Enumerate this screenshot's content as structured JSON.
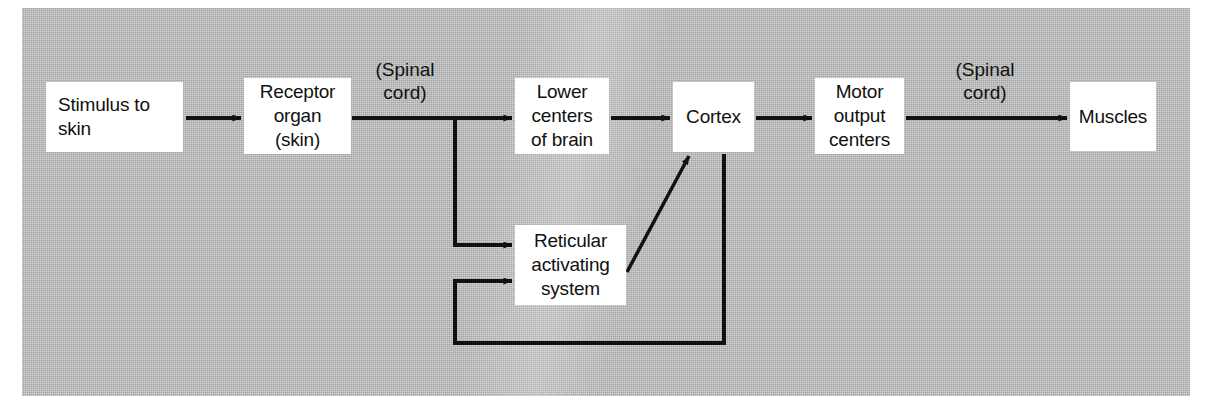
{
  "figure": {
    "kind": "flow-diagram",
    "panel_color": "#b6b6b6",
    "node_fill": "#ffffff",
    "ink_color": "#111111"
  },
  "nodes": [
    {
      "id": "stimulus",
      "label": "Stimulus to\nskin",
      "x": 46,
      "y": 82,
      "w": 137,
      "h": 70
    },
    {
      "id": "receptor",
      "label": "Receptor\norgan\n(skin)",
      "x": 244,
      "y": 78,
      "w": 107,
      "h": 76
    },
    {
      "id": "lower",
      "label": "Lower\ncenters\nof brain",
      "x": 515,
      "y": 78,
      "w": 94,
      "h": 76
    },
    {
      "id": "cortex",
      "label": "Cortex",
      "x": 673,
      "y": 82,
      "w": 81,
      "h": 70
    },
    {
      "id": "motor",
      "label": "Motor\noutput\ncenters",
      "x": 815,
      "y": 78,
      "w": 89,
      "h": 76
    },
    {
      "id": "muscles",
      "label": "Muscles",
      "x": 1070,
      "y": 82,
      "w": 86,
      "h": 69
    },
    {
      "id": "reticular",
      "label": "Reticular\nactivating\nsystem",
      "x": 515,
      "y": 225,
      "w": 111,
      "h": 80
    }
  ],
  "edge_labels": [
    {
      "id": "spinal-cord-afferent",
      "text": "(Spinal\ncord)",
      "x": 355,
      "y": 58,
      "w": 100
    },
    {
      "id": "spinal-cord-efferent",
      "text": "(Spinal\ncord)",
      "x": 925,
      "y": 58,
      "w": 120
    }
  ],
  "edges": [
    {
      "id": "stimulus-to-receptor",
      "from": "stimulus",
      "to": "receptor",
      "type": "straight-arrow"
    },
    {
      "id": "receptor-to-branch",
      "from": "receptor",
      "to": "branch",
      "type": "straight"
    },
    {
      "id": "branch-to-lower-centers",
      "from": "branch",
      "to": "lower",
      "type": "straight-arrow"
    },
    {
      "id": "branch-to-reticular",
      "from": "branch",
      "to": "reticular",
      "type": "elbow-arrow"
    },
    {
      "id": "lower-centers-to-cortex",
      "from": "lower",
      "to": "cortex",
      "type": "straight-arrow"
    },
    {
      "id": "reticular-to-cortex",
      "from": "reticular",
      "to": "cortex",
      "type": "diagonal-arrow"
    },
    {
      "id": "cortex-to-reticular-feedback",
      "from": "cortex",
      "to": "reticular",
      "type": "elbow-arrow"
    },
    {
      "id": "cortex-to-motor-output",
      "from": "cortex",
      "to": "motor",
      "type": "straight-arrow"
    },
    {
      "id": "motor-output-to-muscles",
      "from": "motor",
      "to": "muscles",
      "type": "straight-arrow"
    }
  ]
}
